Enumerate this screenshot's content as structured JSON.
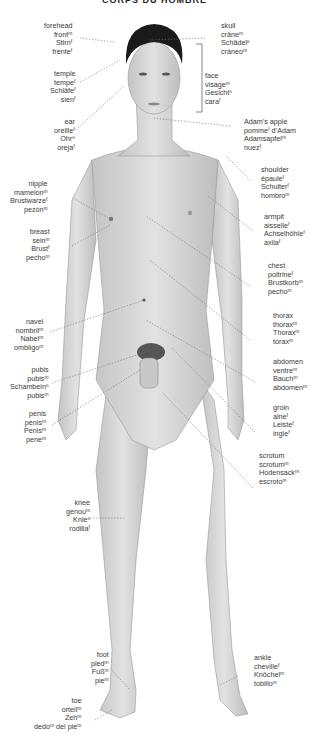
{
  "title": "CORPS DU HOMBRE",
  "colors": {
    "skin": "#d9d9d9",
    "skin_shade": "#b8b8b8",
    "hair": "#1a1a1a",
    "leader": "#777777",
    "text": "#3a3a3a"
  },
  "labels": {
    "forehead": [
      "forehead",
      "frontᵐ",
      "Stirnᶠ",
      "frenteᶠ"
    ],
    "skull": [
      "skull",
      "crâneᵐ",
      "Schädelⁿ",
      "cráneoᵐ"
    ],
    "temple": [
      "temple",
      "tempeᶠ",
      "Schläfeᶠ",
      "sienᶠ"
    ],
    "face": [
      "face",
      "visageᵐ",
      "Gesichtⁿ",
      "caraᶠ"
    ],
    "ear": [
      "ear",
      "oreilleᶠ",
      "Ohrⁿ",
      "orejaᶠ"
    ],
    "adams_apple": [
      "Adam’s apple",
      "pommeᶠ d’Adam",
      "Adamsapfelᵐ",
      "nuezᶠ"
    ],
    "shoulder": [
      "shoulder",
      "épauleᶠ",
      "Schulterᶠ",
      "hombroᵐ"
    ],
    "nipple": [
      "nipple",
      "mamelonᵐ",
      "Brustwarzeᶠ",
      "pezónᵐ"
    ],
    "armpit": [
      "armpit",
      "aisselleᶠ",
      "Achselhöhleᶠ",
      "axilaᶠ"
    ],
    "breast": [
      "breast",
      "seinᵐ",
      "Brustᶠ",
      "pechoᵐ"
    ],
    "chest": [
      "chest",
      "poitrineᶠ",
      "Brustkorbᵐ",
      "pechoᵐ"
    ],
    "thorax": [
      "thorax",
      "thoraxᵐ",
      "Thoraxᵐ",
      "tóraxᵐ"
    ],
    "navel": [
      "navel",
      "nombrilᵐ",
      "Nabelᵐ",
      "ombligoᵐ"
    ],
    "abdomen": [
      "abdomen",
      "ventreᵐ",
      "Bauchᵐ",
      "abdomenᵐ"
    ],
    "pubis": [
      "pubis",
      "pubisᵐ",
      "Schambeinⁿ",
      "pubisᵐ"
    ],
    "groin": [
      "groin",
      "aineᶠ",
      "Leisteᶠ",
      "ingleᶠ"
    ],
    "penis": [
      "penis",
      "pénisᵐ",
      "Penisᵐ",
      "peneᵐ"
    ],
    "scrotum": [
      "scrotum",
      "scrotumᵐ",
      "Hodensackᵐ",
      "escrotoᵐ"
    ],
    "knee": [
      "knee",
      "genouᵐ",
      "Knieⁿ",
      "rodillaᶠ"
    ],
    "foot": [
      "foot",
      "piedᵐ",
      "Fußᵐ",
      "pieᵐ"
    ],
    "ankle": [
      "ankle",
      "chevilleᶠ",
      "Knöchelᵐ",
      "tobilloᵐ"
    ],
    "toe": [
      "toe",
      "orteilᵐ",
      "Zehᵐ",
      "dedoᵐ del pieᵐ"
    ]
  }
}
